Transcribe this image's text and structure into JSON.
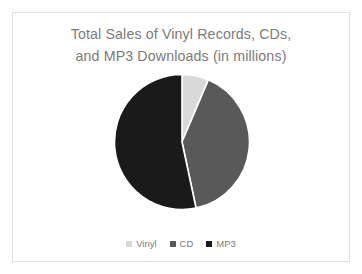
{
  "slide": {
    "background_color": "#ffffff",
    "border_color": "#e2e2e2"
  },
  "title": {
    "full": "Total Sales of Vinyl Records, CDs, and MP3 Downloads (in millions)",
    "line1": "Total Sales of Vinyl Records, CDs,",
    "line2": "and MP3 Downloads (in millions)",
    "color": "#7b7b7b"
  },
  "legend": {
    "position": "bottom",
    "items": [
      {
        "label": "Vinyl",
        "color": "#d9d9d9"
      },
      {
        "label": "CD",
        "color": "#595959"
      },
      {
        "label": "MP3",
        "color": "#1a1a1a"
      }
    ]
  },
  "chart_data": {
    "type": "pie",
    "title": "Total Sales of Vinyl Records, CDs, and MP3 Downloads (in millions)",
    "xlabel": "",
    "ylabel": "",
    "legend_position": "bottom",
    "grid": false,
    "start_angle_deg": 0,
    "direction": "clockwise",
    "categories": [
      "Vinyl",
      "CD",
      "MP3"
    ],
    "values": [
      6.4,
      40.3,
      53.3
    ],
    "units": "millions",
    "slices": [
      {
        "name": "Vinyl",
        "value": 6.4,
        "percent": 6.4,
        "angle_deg": 23,
        "color": "#d9d9d9",
        "start_deg": 0,
        "end_deg": 23
      },
      {
        "name": "CD",
        "value": 40.3,
        "percent": 40.3,
        "angle_deg": 145,
        "color": "#595959",
        "start_deg": 23,
        "end_deg": 168
      },
      {
        "name": "MP3",
        "value": 53.3,
        "percent": 53.3,
        "angle_deg": 192,
        "color": "#1a1a1a",
        "start_deg": 168,
        "end_deg": 360
      }
    ],
    "slice_gap_color": "#ffffff"
  }
}
